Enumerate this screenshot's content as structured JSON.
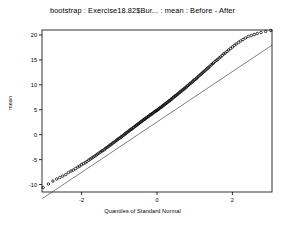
{
  "chart_data": {
    "type": "scatter",
    "title": "bootstrap : Exercise18.82$Bur... : mean : Before - After",
    "xlabel": "Quantiles of Standard Normal",
    "ylabel": "mean",
    "xlim": [
      -3.05,
      3.05
    ],
    "ylim": [
      -11.5,
      21.0
    ],
    "xticks": [
      -2,
      0,
      2
    ],
    "xtick_labels": [
      "-2",
      "0",
      "2"
    ],
    "yticks": [
      -10,
      -5,
      0,
      5,
      10,
      15,
      20
    ],
    "ytick_labels": [
      "-10",
      "-5",
      "0",
      "5",
      "10",
      "15",
      "20"
    ],
    "grid": false,
    "legend": false,
    "reference_line": {
      "label": "qq-reference-line",
      "slope": 5.05,
      "intercept": 2.55,
      "x_from": -3.05,
      "x_to": 3.05
    },
    "series": [
      {
        "name": "bootstrap quantiles",
        "marker": "open-circle",
        "x": [
          -3.02,
          -2.88,
          -2.76,
          -2.66,
          -2.58,
          -2.5,
          -2.42,
          -2.35,
          -2.28,
          -2.22,
          -2.16,
          -2.1,
          -2.05,
          -2.0,
          -1.95,
          -1.9,
          -1.86,
          -1.81,
          -1.77,
          -1.73,
          -1.69,
          -1.65,
          -1.61,
          -1.58,
          -1.54,
          -1.5,
          -1.47,
          -1.44,
          -1.4,
          -1.37,
          -1.34,
          -1.31,
          -1.28,
          -1.25,
          -1.22,
          -1.19,
          -1.16,
          -1.13,
          -1.1,
          -1.07,
          -1.05,
          -1.02,
          -0.99,
          -0.96,
          -0.94,
          -0.91,
          -0.88,
          -0.86,
          -0.83,
          -0.81,
          -0.78,
          -0.76,
          -0.73,
          -0.71,
          -0.68,
          -0.66,
          -0.63,
          -0.61,
          -0.58,
          -0.56,
          -0.54,
          -0.51,
          -0.49,
          -0.47,
          -0.44,
          -0.42,
          -0.4,
          -0.37,
          -0.35,
          -0.33,
          -0.31,
          -0.28,
          -0.26,
          -0.24,
          -0.22,
          -0.19,
          -0.17,
          -0.15,
          -0.13,
          -0.11,
          -0.08,
          -0.06,
          -0.04,
          -0.02,
          0.0,
          0.02,
          0.04,
          0.06,
          0.08,
          0.11,
          0.13,
          0.15,
          0.17,
          0.19,
          0.22,
          0.24,
          0.26,
          0.28,
          0.31,
          0.33,
          0.35,
          0.37,
          0.4,
          0.42,
          0.44,
          0.47,
          0.49,
          0.51,
          0.54,
          0.56,
          0.58,
          0.61,
          0.63,
          0.66,
          0.68,
          0.71,
          0.73,
          0.76,
          0.78,
          0.81,
          0.83,
          0.86,
          0.88,
          0.91,
          0.94,
          0.96,
          0.99,
          1.02,
          1.05,
          1.07,
          1.1,
          1.13,
          1.16,
          1.19,
          1.22,
          1.25,
          1.28,
          1.31,
          1.34,
          1.37,
          1.4,
          1.44,
          1.47,
          1.5,
          1.54,
          1.58,
          1.61,
          1.65,
          1.69,
          1.73,
          1.77,
          1.81,
          1.86,
          1.9,
          1.95,
          2.0,
          2.05,
          2.1,
          2.16,
          2.22,
          2.28,
          2.35,
          2.42,
          2.5,
          2.58,
          2.66,
          2.76,
          2.88,
          3.02
        ],
        "y": [
          -10.6,
          -9.9,
          -9.3,
          -8.9,
          -8.6,
          -8.3,
          -8.0,
          -7.6,
          -7.3,
          -7.1,
          -6.8,
          -6.5,
          -6.3,
          -6.0,
          -5.8,
          -5.6,
          -5.4,
          -5.1,
          -4.9,
          -4.7,
          -4.5,
          -4.3,
          -4.1,
          -3.9,
          -3.7,
          -3.5,
          -3.3,
          -3.2,
          -3.0,
          -2.8,
          -2.6,
          -2.5,
          -2.3,
          -2.1,
          -2.0,
          -1.8,
          -1.6,
          -1.5,
          -1.3,
          -1.1,
          -1.0,
          -0.8,
          -0.7,
          -0.5,
          -0.4,
          -0.2,
          -0.1,
          0.1,
          0.2,
          0.4,
          0.5,
          0.7,
          0.8,
          1.0,
          1.1,
          1.2,
          1.4,
          1.5,
          1.7,
          1.8,
          1.9,
          2.1,
          2.2,
          2.3,
          2.5,
          2.6,
          2.7,
          2.9,
          3.0,
          3.1,
          3.2,
          3.4,
          3.5,
          3.6,
          3.7,
          3.9,
          4.0,
          4.1,
          4.2,
          4.3,
          4.5,
          4.6,
          4.7,
          4.8,
          4.9,
          5.0,
          5.1,
          5.3,
          5.4,
          5.5,
          5.6,
          5.8,
          5.9,
          6.0,
          6.2,
          6.3,
          6.4,
          6.5,
          6.7,
          6.8,
          6.9,
          7.1,
          7.2,
          7.4,
          7.5,
          7.7,
          7.8,
          7.9,
          8.1,
          8.2,
          8.4,
          8.5,
          8.7,
          8.8,
          9.0,
          9.1,
          9.3,
          9.4,
          9.6,
          9.8,
          9.9,
          10.1,
          10.3,
          10.4,
          10.6,
          10.8,
          11.0,
          11.1,
          11.3,
          11.5,
          11.7,
          11.9,
          12.1,
          12.3,
          12.5,
          12.7,
          12.9,
          13.1,
          13.3,
          13.5,
          13.7,
          14.0,
          14.2,
          14.4,
          14.7,
          14.9,
          15.1,
          15.4,
          15.6,
          15.9,
          16.2,
          16.4,
          16.7,
          17.0,
          17.3,
          17.6,
          17.9,
          18.2,
          18.5,
          18.8,
          19.1,
          19.4,
          19.7,
          19.9,
          20.1,
          20.3,
          20.5,
          20.7,
          20.9
        ]
      }
    ]
  },
  "figure": {
    "title": "bootstrap : Exercise18.82$Bur... : mean : Before - After",
    "xlabel": "Quantiles of Standard Normal",
    "ylabel": "mean"
  }
}
